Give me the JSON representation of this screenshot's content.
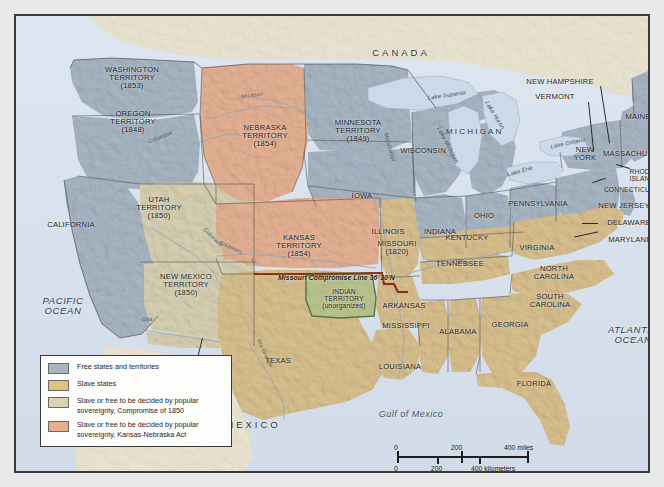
{
  "map": {
    "title": "United States 1854 — Slave and Free States and Territories",
    "countries": [
      {
        "name": "CANADA"
      },
      {
        "name": "MEXICO"
      }
    ],
    "oceans": [
      {
        "name": "PACIFIC\nOCEAN"
      },
      {
        "name": "ATLANTIC\nOCEAN"
      },
      {
        "name": "Gulf of Mexico"
      }
    ],
    "free_states": [
      "CALIFORNIA",
      "IOWA",
      "WISCONSIN",
      "ILLINOIS",
      "INDIANA",
      "OHIO",
      "PENNSYLVANIA",
      "NEW YORK",
      "MAINE",
      "NEW HAMPSHIRE",
      "VERMONT",
      "MASSACHUSETTS",
      "RHODE ISLAND",
      "CONNECTICUT",
      "NEW JERSEY",
      "MICHIGAN"
    ],
    "slave_states": [
      "TEXAS",
      "LOUISIANA",
      "ARKANSAS",
      "MISSISSIPPI",
      "ALABAMA",
      "GEORGIA",
      "FLORIDA",
      "SOUTH CAROLINA",
      "NORTH CAROLINA",
      "TENNESSEE",
      "KENTUCKY",
      "VIRGINIA",
      "MARYLAND",
      "DELAWARE"
    ],
    "labels": {
      "washington_territory": "WASHINGTON\nTERRITORY\n(1853)",
      "oregon_territory": "OREGON\nTERRITORY\n(1848)",
      "utah_territory": "UTAH\nTERRITORY\n(1850)",
      "new_mexico_territory": "NEW MEXICO\nTERRITORY\n(1850)",
      "gadsden_purchase": "GADSDEN\nPURCHASE\n(1853)",
      "nebraska_territory": "NEBRASKA\nTERRITORY\n(1854)",
      "kansas_territory": "KANSAS\nTERRITORY\n(1854)",
      "minnesota_territory": "MINNESOTA\nTERRITORY\n(1849)",
      "indian_territory": "INDIAN\nTERRITORY\n(unorganized)",
      "missouri": "MISSOURI\n(1820)",
      "california": "CALIFORNIA",
      "iowa": "IOWA",
      "wisconsin": "WISCONSIN",
      "michigan": "MICHIGAN",
      "illinois": "ILLINOIS",
      "indiana": "INDIANA",
      "ohio": "OHIO",
      "kentucky": "KENTUCKY",
      "tennessee": "TENNESSEE",
      "arkansas": "ARKANSAS",
      "mississippi": "MISSISSIPPI",
      "alabama": "ALABAMA",
      "georgia": "GEORGIA",
      "florida": "FLORIDA",
      "louisiana": "LOUISIANA",
      "texas": "TEXAS",
      "south_carolina": "SOUTH\nCAROLINA",
      "north_carolina": "NORTH\nCAROLINA",
      "virginia": "VIRGINIA",
      "pennsylvania": "PENNSYLVANIA",
      "new_york": "NEW\nYORK",
      "maine": "MAINE",
      "new_hampshire": "NEW HAMPSHIRE",
      "vermont": "VERMONT",
      "massachusetts": "MASSACHUSETTS",
      "rhode_island": "RHODE\nISLAND",
      "connecticut": "CONNECTICUT",
      "new_jersey": "NEW JERSEY",
      "delaware": "DELAWARE",
      "maryland": "MARYLAND",
      "canada": "CANADA",
      "mexico": "MEXICO",
      "pacific_ocean": "PACIFIC\nOCEAN",
      "atlantic_ocean": "ATLANTIC\nOCEAN",
      "gulf_of_mexico": "Gulf of Mexico",
      "missouri_compromise_line": "Missouri Compromise Line 36°30'N"
    },
    "rivers": [
      {
        "name": "Missouri"
      },
      {
        "name": "Mississippi"
      },
      {
        "name": "Arkansas"
      },
      {
        "name": "Columbia"
      },
      {
        "name": "Colorado"
      },
      {
        "name": "Rio Grande"
      },
      {
        "name": "Ohio"
      },
      {
        "name": "Gila"
      }
    ],
    "lakes": [
      {
        "name": "Lake Superior"
      },
      {
        "name": "Lake Michigan"
      },
      {
        "name": "Lake Huron"
      },
      {
        "name": "Lake Erie"
      },
      {
        "name": "Lake Ontario"
      }
    ],
    "river_labels": {
      "missouri": "Missouri",
      "mississippi": "Mississippi",
      "arkansas": "Arkansas",
      "columbia": "Columbia",
      "colorado": "Colorado",
      "rio_grande": "Rio Grande",
      "ohio": "Ohio",
      "gila": "Gila"
    },
    "lake_labels": {
      "superior": "Lake Superior",
      "michigan": "Lake Michigan",
      "huron": "Lake Huron",
      "erie": "Lake Erie",
      "ontario": "Lake Ontario"
    }
  },
  "legend": {
    "items": [
      {
        "color": "#a8b6c4",
        "text": "Free states and territories"
      },
      {
        "color": "#e0c27c",
        "text": "Slave states"
      },
      {
        "color": "#d9d2b4",
        "text": "Slave or free to be decided\nby popular sovereignty,\nCompromise of 1850"
      },
      {
        "color": "#e8ae8b",
        "text": "Slave or free to be decided\nby popular sovereignty,\nKansas-Nebraska Act"
      }
    ]
  },
  "scale": {
    "miles": {
      "ticks": [
        "0",
        "200",
        "400"
      ],
      "unit": "miles"
    },
    "kilometers": {
      "ticks": [
        "0",
        "200",
        "400"
      ],
      "unit": "kilometers"
    },
    "miles_label": "400 miles",
    "km_label": "400 kilometers",
    "miles_0": "0",
    "miles_200": "200",
    "km_0": "0",
    "km_200": "200"
  },
  "colors": {
    "free": "#a8b6c4",
    "slave": "#d8bf8e",
    "popular_sovereignty_1850": "#d7d0b2",
    "kansas_nebraska": "#e5b193",
    "foreign_land": "#e8e2cf",
    "water": "#dbe4ee",
    "indian_territory_outline": "#4f7a3c",
    "compromise_line": "#8a2f14",
    "frame": "#3a3a3c"
  }
}
